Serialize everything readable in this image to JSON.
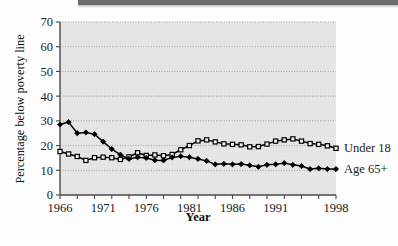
{
  "figure": {
    "background_color": "#fdfdfd",
    "plot_background_color": "#e4e4e4",
    "axis_color": "#4a4a4a",
    "gridline_color": "#8a8a8a",
    "series_color": "#000000"
  },
  "chart_data": {
    "type": "line",
    "title": "",
    "xlabel": "Year",
    "ylabel": "Percentage below poverty line",
    "xlim": [
      1966,
      1998
    ],
    "ylim": [
      0,
      70
    ],
    "grid": true,
    "legend_position": "right-inline",
    "x_tick_labels": [
      "1966",
      "1971",
      "1976",
      "1981",
      "1986",
      "1991",
      "1998"
    ],
    "x_tick_values": [
      1966,
      1971,
      1976,
      1981,
      1986,
      1991,
      1998
    ],
    "y_tick_labels": [
      "0",
      "10",
      "20",
      "30",
      "40",
      "50",
      "60",
      "70"
    ],
    "y_tick_values": [
      0,
      10,
      20,
      30,
      40,
      50,
      60,
      70
    ],
    "x": [
      1966,
      1967,
      1968,
      1969,
      1970,
      1971,
      1972,
      1973,
      1974,
      1975,
      1976,
      1977,
      1978,
      1979,
      1980,
      1981,
      1982,
      1983,
      1984,
      1985,
      1986,
      1987,
      1988,
      1989,
      1990,
      1991,
      1992,
      1993,
      1994,
      1995,
      1996,
      1997,
      1998
    ],
    "series": [
      {
        "name": "Under 18",
        "marker": "open-square",
        "label": "Under 18",
        "values": [
          17.6,
          16.6,
          15.6,
          14.0,
          15.1,
          15.3,
          15.1,
          14.4,
          15.4,
          17.1,
          16.0,
          16.2,
          15.9,
          16.4,
          18.3,
          20.0,
          21.9,
          22.3,
          21.5,
          20.7,
          20.5,
          20.3,
          19.5,
          19.6,
          20.6,
          21.8,
          22.3,
          22.7,
          21.8,
          20.8,
          20.5,
          19.9,
          18.9
        ]
      },
      {
        "name": "Age 65+",
        "marker": "filled-diamond",
        "label": "Age 65+",
        "values": [
          28.5,
          29.5,
          25.0,
          25.3,
          24.6,
          21.6,
          18.6,
          16.3,
          14.6,
          15.3,
          15.0,
          14.1,
          14.0,
          15.2,
          15.7,
          15.3,
          14.6,
          13.8,
          12.4,
          12.6,
          12.4,
          12.5,
          12.0,
          11.4,
          12.2,
          12.4,
          12.9,
          12.2,
          11.7,
          10.5,
          10.8,
          10.5,
          10.5
        ]
      }
    ]
  }
}
